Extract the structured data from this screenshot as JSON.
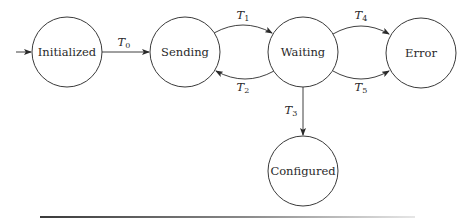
{
  "diagram": {
    "type": "state-machine",
    "states": [
      {
        "id": "initialized",
        "label": "Initialized",
        "cx": 67,
        "cy": 52,
        "r": 35,
        "initial": true
      },
      {
        "id": "sending",
        "label": "Sending",
        "cx": 185,
        "cy": 52,
        "r": 35
      },
      {
        "id": "waiting",
        "label": "Waiting",
        "cx": 303,
        "cy": 52,
        "r": 35
      },
      {
        "id": "error",
        "label": "Error",
        "cx": 421,
        "cy": 53,
        "r": 35
      },
      {
        "id": "configured",
        "label": "Configured",
        "cx": 303,
        "cy": 171,
        "r": 35
      }
    ],
    "transitions": [
      {
        "id": "T0",
        "letter": "T",
        "sub": "0",
        "from": "initialized",
        "to": "sending"
      },
      {
        "id": "T1",
        "letter": "T",
        "sub": "1",
        "from": "sending",
        "to": "waiting"
      },
      {
        "id": "T2",
        "letter": "T",
        "sub": "2",
        "from": "waiting",
        "to": "sending"
      },
      {
        "id": "T3",
        "letter": "T",
        "sub": "3",
        "from": "waiting",
        "to": "configured"
      },
      {
        "id": "T4",
        "letter": "T",
        "sub": "4",
        "from": "waiting",
        "to": "error"
      },
      {
        "id": "T5",
        "letter": "T",
        "sub": "5",
        "from": "waiting",
        "to": "error"
      }
    ],
    "colors": {
      "stroke": "#3a3a3a",
      "text": "#2a2a2a",
      "background": "#ffffff"
    }
  }
}
